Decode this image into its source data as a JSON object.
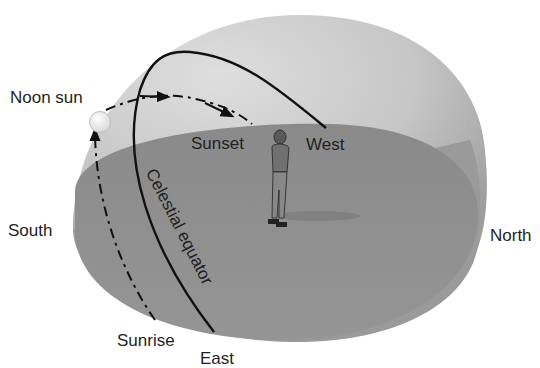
{
  "diagram": {
    "type": "celestial-sphere-sun-path",
    "labels": {
      "noon_sun": "Noon sun",
      "sunset": "Sunset",
      "west": "West",
      "south": "South",
      "north": "North",
      "sunrise": "Sunrise",
      "east": "East",
      "celestial_equator": "Celestial equator"
    },
    "colors": {
      "dome": "#c4c4c4",
      "dome_highlight": "#e2e2e2",
      "horizon_plane": "#8e8e8e",
      "lines": "#111111",
      "sun": "#f4f4f4"
    }
  }
}
